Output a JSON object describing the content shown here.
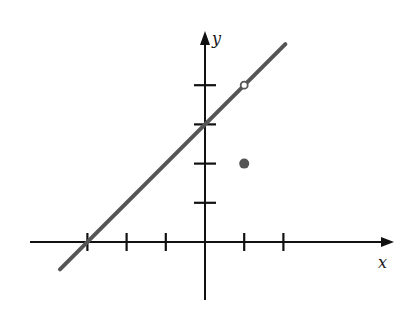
{
  "chart_data": {
    "type": "line",
    "title": "",
    "xlabel": "x",
    "ylabel": "y",
    "xlim": [
      -4.5,
      4.8
    ],
    "ylim": [
      -1.5,
      5.3
    ],
    "grid": false,
    "legend": null,
    "x_ticks": [
      -3,
      -2,
      -1,
      1,
      2
    ],
    "y_ticks": [
      1,
      2,
      3,
      4
    ],
    "tick_labels_shown": false,
    "series": [
      {
        "name": "line y = x + 3",
        "kind": "line",
        "equation": "y = x + 3",
        "x": [
          -3.7,
          2.05
        ],
        "y": [
          -0.7,
          5.05
        ],
        "color": "#555555"
      },
      {
        "name": "open point",
        "kind": "point",
        "style": "open",
        "x": [
          1
        ],
        "y": [
          4
        ],
        "color": "#555555"
      },
      {
        "name": "filled point",
        "kind": "point",
        "style": "filled",
        "x": [
          1
        ],
        "y": [
          2
        ],
        "color": "#555555"
      }
    ],
    "annotations": []
  },
  "colors": {
    "axis": "#111111",
    "line": "#555555",
    "point": "#555555",
    "background": "#ffffff"
  }
}
